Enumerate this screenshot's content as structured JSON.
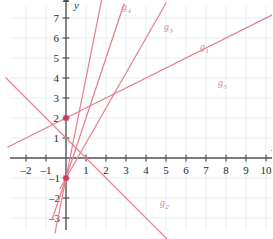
{
  "chart_data": {
    "type": "line",
    "title": "",
    "subtitle": "",
    "xlabel": "x",
    "ylabel": "y",
    "xlim": [
      -2.8,
      10.6
    ],
    "ylim": [
      -3.6,
      7.6
    ],
    "grid": true,
    "grid_color": "#dfe8ee",
    "axis_color": "#555555",
    "line_color": "#e8808f",
    "point_color": "#d1355b",
    "legend_position": "inline-labels",
    "x_ticks": [
      -2,
      -1,
      1,
      2,
      3,
      4,
      5,
      6,
      7,
      8,
      9,
      10
    ],
    "x_tick_labels": [
      "-2",
      "-1",
      "1",
      "2",
      "3",
      "4",
      "5",
      "6",
      "7",
      "8",
      "9",
      "10"
    ],
    "y_ticks": [
      -3,
      -2,
      -1,
      1,
      2,
      3,
      4,
      5,
      6,
      7
    ],
    "y_tick_labels": [
      "-3",
      "-2",
      "-1",
      "1",
      "2",
      "3",
      "4",
      "5",
      "6",
      "7"
    ],
    "marked_points": [
      {
        "name": "point-0-2",
        "x": 0,
        "y": 2
      },
      {
        "name": "point-0-minus1",
        "x": 0,
        "y": -1
      }
    ],
    "series": [
      {
        "name": "g1",
        "label": "g",
        "subscript": "1",
        "slope": 1.75,
        "intercept": -1,
        "label_x": 6.7,
        "label_y": 5.4,
        "x_start": -0.3,
        "x_end": 5.0
      },
      {
        "name": "g2",
        "label": "g",
        "subscript": "2",
        "slope": -1.0,
        "intercept": 1.0,
        "label_x": 4.7,
        "label_y": -2.4,
        "x_start": -3.0,
        "x_end": 5.2
      },
      {
        "name": "g3",
        "label": "g",
        "subscript": "3",
        "slope": 3.0,
        "intercept": -1.0,
        "label_x": 4.9,
        "label_y": 6.4,
        "x_start": -0.7,
        "x_end": 2.9
      },
      {
        "name": "g4",
        "label": "g",
        "subscript": "4",
        "slope": 5.0,
        "intercept": -1.0,
        "label_x": 2.8,
        "label_y": 7.4,
        "x_start": -0.55,
        "x_end": 2.1
      },
      {
        "name": "g5",
        "label": "g",
        "subscript": "5",
        "slope": 0.5,
        "intercept": 2.0,
        "label_x": 7.6,
        "label_y": 3.6,
        "x_start": -2.9,
        "x_end": 10.4
      }
    ],
    "annotations": []
  },
  "figure": {
    "origin_px": {
      "x": 66,
      "y": 158
    },
    "unit_px": 20,
    "x_axis_arrow": true,
    "y_axis_arrow": true
  }
}
